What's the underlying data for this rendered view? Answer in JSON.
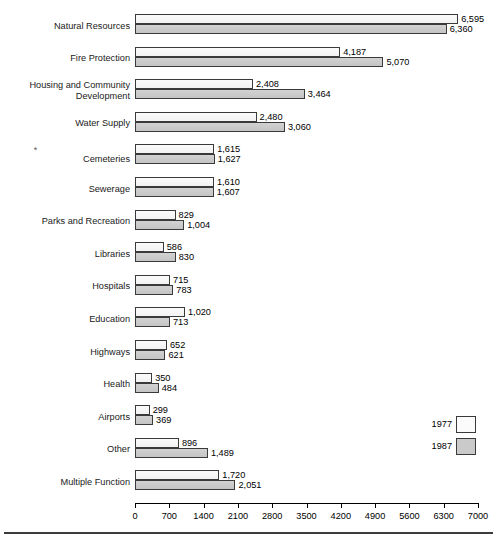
{
  "chart_data": {
    "type": "bar",
    "orientation": "horizontal",
    "title": "",
    "xlabel": "",
    "ylabel": "",
    "xlim": [
      0,
      7000
    ],
    "xticks": [
      0,
      700,
      1400,
      2100,
      2800,
      3500,
      4200,
      4900,
      5600,
      6300,
      7000
    ],
    "xtick_labels": [
      "0",
      "700",
      "1400",
      "2100",
      "2800",
      "3500",
      "4200",
      "4900",
      "5600",
      "6300",
      "7000"
    ],
    "grid": false,
    "legend_position": "right-bottom",
    "categories": [
      "Natural Resources",
      "Fire Protection",
      "Housing and Community\nDevelopment",
      "Water Supply",
      "Cemeteries",
      "Sewerage",
      "Parks and Recreation",
      "Libraries",
      "Hospitals",
      "Education",
      "Highways",
      "Health",
      "Airports",
      "Other",
      "Multiple Function"
    ],
    "series": [
      {
        "name": "1977",
        "color": "#fbfbfb",
        "values": [
          6595,
          4187,
          2408,
          2480,
          1615,
          1610,
          829,
          586,
          715,
          1020,
          652,
          350,
          299,
          896,
          1720
        ],
        "labels": [
          "6,595",
          "4,187",
          "2,408",
          "2,480",
          "1,615",
          "1,610",
          "829",
          "586",
          "715",
          "1,020",
          "652",
          "350",
          "299",
          "896",
          "1,720"
        ]
      },
      {
        "name": "1987",
        "color": "#cacaca",
        "values": [
          6360,
          5070,
          3464,
          3060,
          1627,
          1607,
          1004,
          830,
          783,
          713,
          621,
          484,
          369,
          1489,
          2051
        ],
        "labels": [
          "6,360",
          "5,070",
          "3,464",
          "3,060",
          "1,627",
          "1,607",
          "1,004",
          "830",
          "783",
          "713",
          "621",
          "484",
          "369",
          "1,489",
          "2,051"
        ]
      }
    ],
    "footnote_markers": {
      "Cemeteries": "*"
    }
  },
  "legend": {
    "items": [
      {
        "label": "1977",
        "swatch": "white-swatch"
      },
      {
        "label": "1987",
        "swatch": "gray-swatch"
      }
    ]
  },
  "axis": {
    "tick_labels": [
      "0",
      "700",
      "1400",
      "2100",
      "2800",
      "3500",
      "4200",
      "4900",
      "5600",
      "6300",
      "7000"
    ]
  }
}
